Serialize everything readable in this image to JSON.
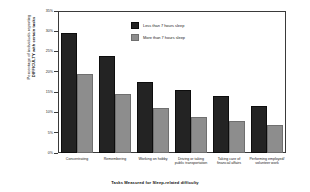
{
  "chart_data": {
    "type": "bar",
    "title": "",
    "xlabel": "Tasks Measured for Sleep-related difficulty",
    "ylabel_line1": "Percentage of individuals reporting",
    "ylabel_line2": "DIFFICULTY with certain tasks",
    "categories": [
      "Concentrating",
      "Remembering",
      "Working on hobby",
      "Driving or taking public transportation",
      "Taking care of financial affairs",
      "Performing employed/ volunteer work"
    ],
    "category_lines": [
      [
        "Concentrating"
      ],
      [
        "Remembering"
      ],
      [
        "Working on hobby"
      ],
      [
        "Driving or taking",
        "public transportation"
      ],
      [
        "Taking care of",
        "financial affairs"
      ],
      [
        "Performing employed/",
        "volunteer work"
      ]
    ],
    "series": [
      {
        "name": "Less than 7 hours sleep",
        "color": "#232323",
        "values": [
          29.5,
          24.0,
          17.5,
          15.5,
          14.0,
          11.5
        ]
      },
      {
        "name": "More than 7 hours sleep",
        "color": "#8d8d8d",
        "values": [
          19.5,
          14.5,
          11.0,
          8.8,
          8.0,
          7.0
        ]
      }
    ],
    "ylim": [
      0,
      35
    ],
    "yticks": [
      0,
      5,
      10,
      15,
      20,
      25,
      30,
      35
    ],
    "ytick_labels": [
      "0%",
      "5%",
      "10%",
      "15%",
      "20%",
      "25%",
      "30%",
      "35%"
    ],
    "grid": false,
    "legend_position": "top-center"
  }
}
